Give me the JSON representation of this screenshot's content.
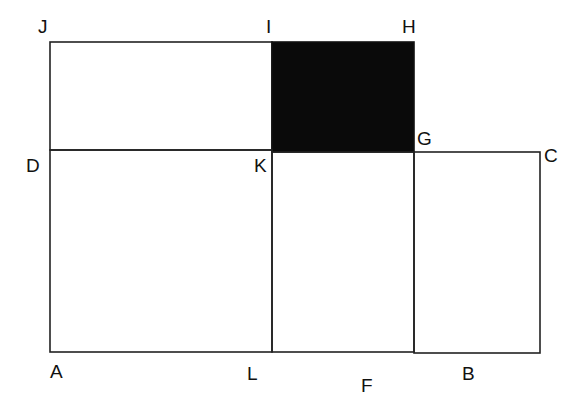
{
  "diagram": {
    "type": "geometry-figure",
    "colors": {
      "light_fill": "#e2e2e2",
      "dark_fill": "#0a0a0a",
      "white_fill": "#ffffff",
      "stroke": "#222222"
    },
    "points": {
      "J": {
        "label": "J",
        "x": 50,
        "y": 42
      },
      "I": {
        "label": "I",
        "x": 272,
        "y": 42
      },
      "H": {
        "label": "H",
        "x": 414,
        "y": 42
      },
      "D": {
        "label": "D",
        "x": 50,
        "y": 150
      },
      "K": {
        "label": "K",
        "x": 272,
        "y": 150
      },
      "G": {
        "label": "G",
        "x": 414,
        "y": 152
      },
      "C": {
        "label": "C",
        "x": 540,
        "y": 152
      },
      "A": {
        "label": "A",
        "x": 50,
        "y": 352
      },
      "L": {
        "label": "L",
        "x": 272,
        "y": 352
      },
      "F": {
        "label": "F",
        "x": 414,
        "y": 352
      },
      "B": {
        "label": "B",
        "x": 540,
        "y": 353
      }
    },
    "regions": [
      {
        "name": "rect-JIKD",
        "vertices": "J-I-K-D",
        "fill": "light"
      },
      {
        "name": "rect-IHGK",
        "vertices": "I-H-G-K",
        "fill": "dark"
      },
      {
        "name": "square-DKLA",
        "vertices": "D-K-L-A",
        "fill": "white"
      },
      {
        "name": "rect-KGFL",
        "vertices": "K-G-F-L",
        "fill": "white"
      },
      {
        "name": "square-GCBF",
        "vertices": "G-C-B-F",
        "fill": "light"
      }
    ]
  }
}
